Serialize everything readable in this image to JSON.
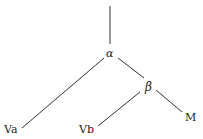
{
  "diagram": {
    "type": "tree",
    "nodes": {
      "alpha": {
        "label": "α"
      },
      "beta": {
        "label": "β"
      },
      "va": {
        "label": "Va"
      },
      "vb": {
        "label": "Vb"
      },
      "m": {
        "label": "M"
      }
    },
    "edges": [
      [
        "root",
        "α"
      ],
      [
        "α",
        "Va"
      ],
      [
        "α",
        "β"
      ],
      [
        "β",
        "Vb"
      ],
      [
        "β",
        "M"
      ]
    ]
  }
}
